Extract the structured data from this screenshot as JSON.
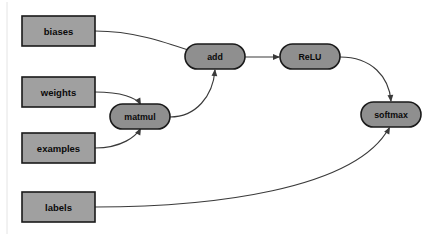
{
  "diagram": {
    "background_color": "#ffffff",
    "node_fill_rect": "#a0a0a0",
    "node_fill_pill": "#8f8f8f",
    "node_stroke": "#1a1a1a",
    "edge_color": "#3a3a3a"
  },
  "nodes": [
    {
      "id": "biases",
      "label": "biases",
      "shape": "rectangle",
      "x": 22,
      "y": 16,
      "w": 73,
      "h": 30
    },
    {
      "id": "weights",
      "label": "weights",
      "shape": "rectangle",
      "x": 22,
      "y": 77,
      "w": 73,
      "h": 30
    },
    {
      "id": "examples",
      "label": "examples",
      "shape": "rectangle",
      "x": 22,
      "y": 133,
      "w": 73,
      "h": 30
    },
    {
      "id": "labels",
      "label": "labels",
      "shape": "rectangle",
      "x": 22,
      "y": 192,
      "w": 73,
      "h": 30
    },
    {
      "id": "matmul",
      "label": "matmul",
      "shape": "pill",
      "x": 110,
      "y": 104,
      "w": 60,
      "h": 25
    },
    {
      "id": "add",
      "label": "add",
      "shape": "pill",
      "x": 185,
      "y": 44,
      "w": 60,
      "h": 25
    },
    {
      "id": "relu",
      "label": "ReLU",
      "shape": "pill",
      "x": 280,
      "y": 44,
      "w": 60,
      "h": 25
    },
    {
      "id": "softmax",
      "label": "softmax",
      "shape": "pill",
      "x": 361,
      "y": 102,
      "w": 60,
      "h": 25
    }
  ],
  "edges": [
    {
      "id": "biases-to-add",
      "from": "biases",
      "to": "add",
      "path": "M 95 31 C 140 31 175 46 209 57",
      "arrow_at": [
        211,
        58
      ],
      "arrow_angle": 20
    },
    {
      "id": "weights-to-matmul",
      "from": "weights",
      "to": "matmul",
      "path": "M 95 92 C 122 92 136 98 140 104",
      "arrow_at": [
        141,
        105
      ],
      "arrow_angle": 62
    },
    {
      "id": "examples-to-matmul",
      "from": "examples",
      "to": "matmul",
      "path": "M 95 148 C 122 148 136 136 140 129",
      "arrow_at": [
        141,
        128
      ],
      "arrow_angle": -62
    },
    {
      "id": "matmul-to-add",
      "from": "matmul",
      "to": "add",
      "path": "M 170 117 C 196 117 213 96 215 70",
      "arrow_at": [
        215,
        69
      ],
      "arrow_angle": -85
    },
    {
      "id": "add-to-relu",
      "from": "add",
      "to": "relu",
      "path": "M 245 57 L 279 57",
      "arrow_at": [
        280,
        57
      ],
      "arrow_angle": 0
    },
    {
      "id": "relu-to-softmax",
      "from": "relu",
      "to": "softmax",
      "path": "M 340 57 C 372 57 389 77 391 101",
      "arrow_at": [
        391,
        102
      ],
      "arrow_angle": 85
    },
    {
      "id": "labels-to-softmax",
      "from": "labels",
      "to": "softmax",
      "path": "M 95 207 C 210 207 355 190 389 128",
      "arrow_at": [
        390,
        127
      ],
      "arrow_angle": -62
    }
  ]
}
